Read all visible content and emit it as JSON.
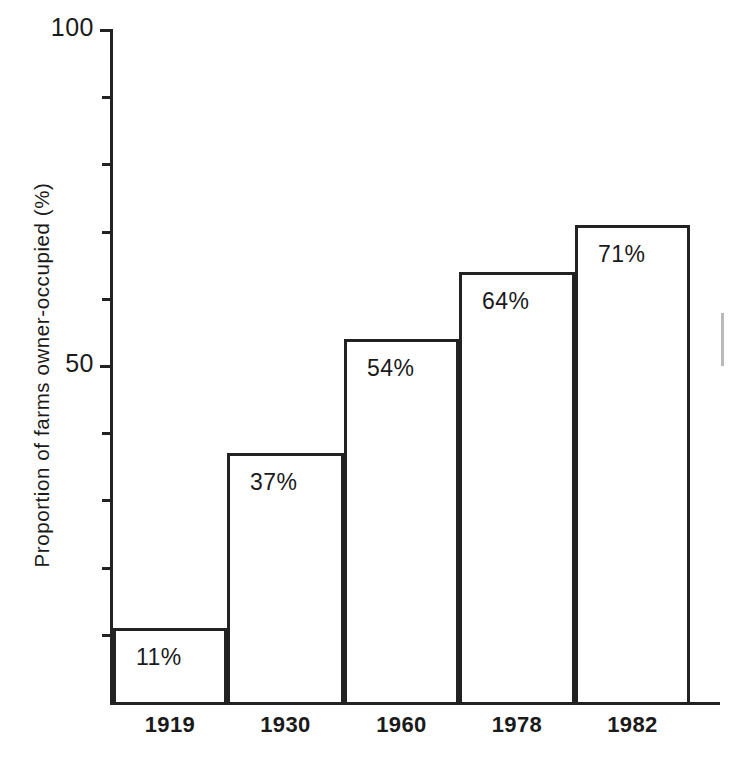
{
  "chart_data": {
    "type": "bar",
    "title": "",
    "xlabel": "",
    "ylabel": "Proportion of farms owner-occupied (%)",
    "categories": [
      "1919",
      "1930",
      "1960",
      "1978",
      "1982"
    ],
    "values": [
      11,
      37,
      54,
      64,
      71
    ],
    "data_labels": [
      "11%",
      "37%",
      "54%",
      "64%",
      "71%"
    ],
    "ylim": [
      0,
      100
    ],
    "y_ticks_labeled": [
      "100",
      "50"
    ],
    "y_tick_values_labeled": [
      100,
      50
    ],
    "y_tick_values_all": [
      100,
      90,
      80,
      70,
      60,
      50,
      40,
      30,
      20,
      10
    ],
    "grid": false,
    "legend": null,
    "series": [
      {
        "name": "Proportion of farms owner-occupied (%)",
        "values": [
          11,
          37,
          54,
          64,
          71
        ]
      }
    ],
    "colors": {
      "bar_fill": "#ffffff",
      "bar_outline": "#222222",
      "axis": "#222222",
      "text": "#1a1a1a"
    }
  },
  "axis": {
    "y_title": "Proportion of farms owner-occupied (%)",
    "y_labels": [
      {
        "text": "100",
        "value": 100
      },
      {
        "text": "50",
        "value": 50
      }
    ]
  },
  "bars": [
    {
      "label": "1919",
      "value_label": "11%",
      "value": 11
    },
    {
      "label": "1930",
      "value_label": "37%",
      "value": 37
    },
    {
      "label": "1960",
      "value_label": "54%",
      "value": 54
    },
    {
      "label": "1978",
      "value_label": "64%",
      "value": 64
    },
    {
      "label": "1982",
      "value_label": "71%",
      "value": 71
    }
  ]
}
